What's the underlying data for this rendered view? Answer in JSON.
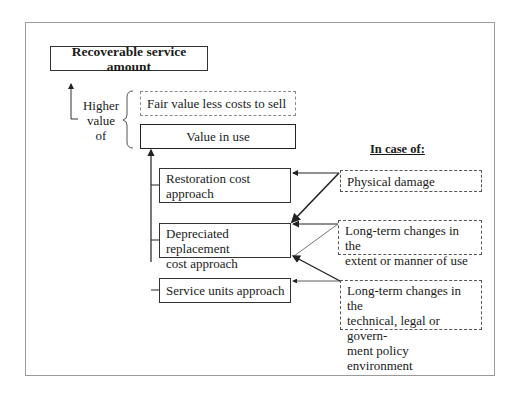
{
  "diagram": {
    "title": "Recoverable service amount",
    "selector_label_lines": [
      "Higher",
      "value",
      "of"
    ],
    "options": {
      "fair_value": "Fair value less costs to sell",
      "value_in_use": "Value in use"
    },
    "approaches": [
      {
        "line1": "Restoration cost",
        "line2": "approach"
      },
      {
        "line1": "Depreciated replacement",
        "line2": "cost approach"
      },
      {
        "line1": "Service units approach",
        "line2": ""
      }
    ],
    "cases_heading": "In case of:",
    "cases": [
      {
        "lines": [
          "Physical damage"
        ]
      },
      {
        "lines": [
          "Long-term changes in the",
          "extent or manner of use"
        ]
      },
      {
        "lines": [
          "Long-term changes in the",
          "technical, legal or govern-",
          "ment policy environment"
        ]
      }
    ],
    "connections": [
      {
        "from": "Physical damage",
        "to": [
          "Restoration cost approach",
          "Depreciated replacement cost approach"
        ]
      },
      {
        "from": "Long-term changes in the extent or manner of use",
        "to": [
          "Depreciated replacement cost approach"
        ]
      },
      {
        "from": "Long-term changes in the technical, legal or government policy environment",
        "to": [
          "Depreciated replacement cost approach",
          "Service units approach"
        ]
      }
    ]
  }
}
